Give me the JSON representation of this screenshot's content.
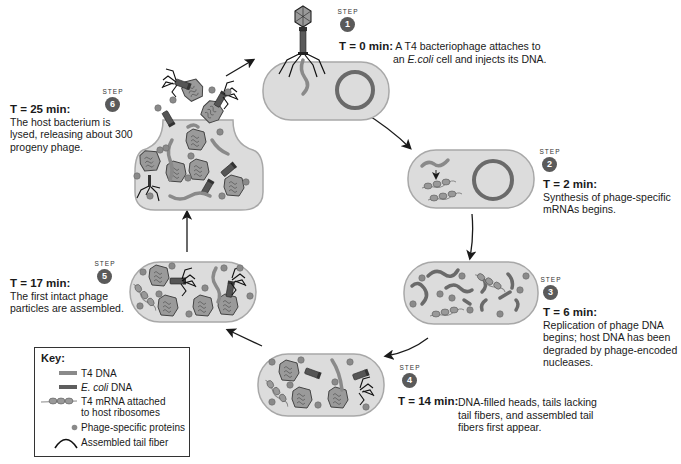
{
  "steps": [
    {
      "step_word": "STEP",
      "number": "1",
      "time": "T = 0 min:",
      "description_line1": "A T4 bacteriophage attaches to",
      "description_line2": "an E.coli cell and injects its DNA.",
      "ecoli_prefix": "an ",
      "ecoli_italic": "E.coli",
      "ecoli_suffix": " cell and injects its DNA."
    },
    {
      "step_word": "STEP",
      "number": "2",
      "time": "T = 2 min:",
      "description_line1": "Synthesis of phage-specific",
      "description_line2": "mRNAs begins."
    },
    {
      "step_word": "STEP",
      "number": "3",
      "time": "T = 6 min:",
      "description_line1": "Replication of phage DNA",
      "description_line2": "begins; host DNA has been",
      "description_line3": "degraded by phage-encoded",
      "description_line4": "nucleases."
    },
    {
      "step_word": "STEP",
      "number": "4",
      "time": "T = 14 min:",
      "description_line1": "DNA-filled heads, tails lacking",
      "description_line2": "tail fibers, and assembled tail",
      "description_line3": "fibers first appear."
    },
    {
      "step_word": "STEP",
      "number": "5",
      "time": "T = 17 min:",
      "description_line1": "The first intact phage",
      "description_line2": "particles are assembled."
    },
    {
      "step_word": "STEP",
      "number": "6",
      "time": "T = 25 min:",
      "description_line1": "The host bacterium is",
      "description_line2": "lysed, releasing about 300",
      "description_line3": "progeny phage."
    }
  ],
  "key": {
    "title": "Key:",
    "items": [
      {
        "symbol": "t4-dna-line",
        "label": "T4 DNA",
        "color": "#8a8a8a"
      },
      {
        "symbol": "ecoli-dna-line",
        "label_italic": "E. coli",
        "label_rest": " DNA",
        "color": "#5e5e5e"
      },
      {
        "symbol": "mrna-ribosomes",
        "label_line1": "T4 mRNA attached",
        "label_line2": "to host ribosomes"
      },
      {
        "symbol": "protein-dot",
        "label": "Phage-specific proteins",
        "color": "#8a8a8a"
      },
      {
        "symbol": "tail-fiber-arc",
        "label": "Assembled tail fiber"
      }
    ]
  },
  "colors": {
    "cell_fill": "#dcdcdc",
    "cell_stroke": "#a8a8a8",
    "t4_dna": "#8a8a8a",
    "ecoli_dna": "#6a6a6a",
    "phage_head": "#9a9a9a",
    "step_badge": "#5a5a5a",
    "arrow": "#1a1a1a"
  }
}
